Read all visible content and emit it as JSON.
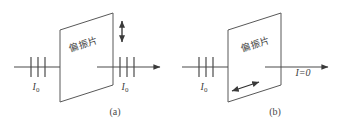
{
  "figure": {
    "type": "physics-optics-diagram",
    "background_color": "#ffffff",
    "line_color": "#4a4a4a",
    "panels": [
      {
        "id": "a",
        "caption": "(a)",
        "plate_label": "偏振片",
        "incident_label": "I",
        "incident_sub": "0",
        "outgoing_label": "I",
        "outgoing_sub": "0",
        "incident_ticks": 3,
        "outgoing_ticks": 3,
        "polarization_arrow": "vertical-double-arrow"
      },
      {
        "id": "b",
        "caption": "(b)",
        "plate_label": "偏振片",
        "incident_label": "I",
        "incident_sub": "0",
        "outgoing_label": "I=0",
        "incident_ticks": 3,
        "outgoing_ticks": 0,
        "polarization_arrow": "diagonal-double-arrow"
      }
    ]
  }
}
